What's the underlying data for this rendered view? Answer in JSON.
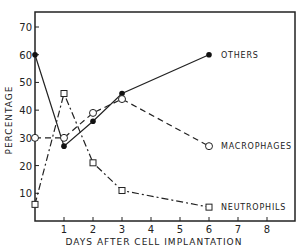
{
  "chart_data": {
    "type": "line",
    "title": "",
    "xlabel": "DAYS AFTER CELL IMPLANTATION",
    "ylabel": "PERCENTAGE",
    "x_ticks": [
      1,
      2,
      3,
      4,
      5,
      6,
      7,
      8
    ],
    "y_ticks": [
      10,
      20,
      30,
      40,
      50,
      60,
      70
    ],
    "xlim": [
      0,
      9
    ],
    "ylim": [
      0,
      75
    ],
    "grid": false,
    "legend_position": "inline labels at line ends",
    "series": [
      {
        "name": "OTHERS",
        "marker": "filled-circle",
        "line": "solid",
        "x": [
          0,
          1,
          2,
          3,
          6
        ],
        "values": [
          60,
          27,
          36,
          46,
          60
        ]
      },
      {
        "name": "MACROPHAGES",
        "marker": "open-circle",
        "line": "dashed",
        "x": [
          0,
          1,
          2,
          3,
          6
        ],
        "values": [
          30,
          30,
          39,
          44,
          27
        ]
      },
      {
        "name": "NEUTROPHILS",
        "marker": "open-square",
        "line": "dash-dot",
        "x": [
          0,
          1,
          2,
          3,
          6
        ],
        "values": [
          6,
          46,
          21,
          11,
          5
        ]
      }
    ]
  }
}
